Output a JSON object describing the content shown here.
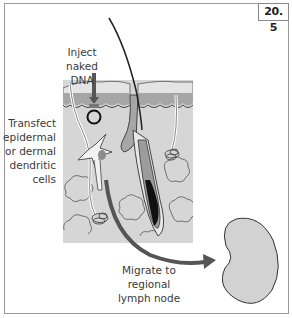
{
  "figure": {
    "number": "20. 5",
    "labels": {
      "inject": [
        "Inject naked",
        "DNA"
      ],
      "transfect": [
        "Transfect",
        "epidermal",
        "or dermal",
        "dendritic",
        "cells"
      ],
      "migrate": [
        "Migrate to regional",
        "lymph node"
      ]
    },
    "elements": [
      "skin-cross-section",
      "hair-follicle",
      "hair-shaft",
      "injection-arrow",
      "dna-plasmid-ring",
      "dendritic-cell",
      "sweat-glands",
      "fat-lobules",
      "migration-arrow",
      "lymph-node"
    ],
    "colors": {
      "skin_fill": "#d4d4d4",
      "epidermis_band": "#a8a8a8",
      "arrow": "#555555",
      "lymph_node_fill": "#d2d2d2",
      "outline": "#333333"
    }
  }
}
